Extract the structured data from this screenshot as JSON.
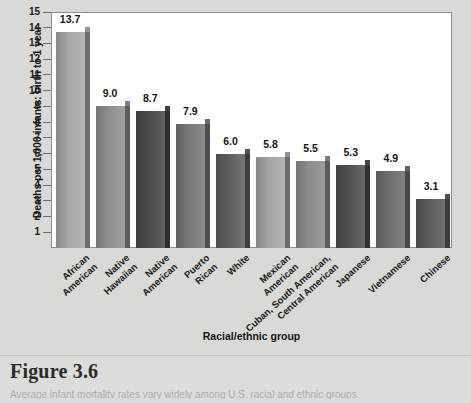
{
  "chart_data": {
    "type": "bar",
    "title": "",
    "xlabel": "Racial/ethnic group",
    "ylabel": "Deaths per 1,000 infants: birth to 1 year",
    "ylim": [
      0,
      15
    ],
    "yticks": [
      15,
      14,
      13,
      12,
      11,
      10,
      9,
      8,
      7,
      6,
      5,
      4,
      3,
      2,
      1
    ],
    "grid": false,
    "legend": "none",
    "categories": [
      "African\nAmerican",
      "Native\nHawaiian",
      "Native\nAmerican",
      "Puerto\nRican",
      "White",
      "Mexican\nAmerican",
      "Cuban, South American,\nCentral American",
      "Japanese",
      "Vietnamese",
      "Chinese"
    ],
    "values": [
      13.7,
      9.0,
      8.7,
      7.9,
      6.0,
      5.8,
      5.5,
      5.3,
      4.9,
      3.1
    ],
    "value_labels": [
      "13.7",
      "9.0",
      "8.7",
      "7.9",
      "6.0",
      "5.8",
      "5.5",
      "5.3",
      "4.9",
      "3.1"
    ],
    "bar_colors": [
      "#a8a8a8",
      "#8f8f8f",
      "#4a4a4a",
      "#787878",
      "#5e5e5e",
      "#a5a5a5",
      "#8c8c8c",
      "#4f4f4f",
      "#6d6d6d",
      "#5a5a5a"
    ]
  },
  "axis": {
    "y_title": "Deaths per 1,000 infants: birth to 1 year",
    "x_title": "Racial/ethnic group",
    "y_tick_labels": [
      "15",
      "14",
      "13",
      "12",
      "11",
      "10",
      "9",
      "8",
      "7",
      "6",
      "5",
      "4",
      "3",
      "2",
      "1"
    ]
  },
  "category_labels": [
    [
      "African",
      "American"
    ],
    [
      "Native",
      "Hawaiian"
    ],
    [
      "Native",
      "American"
    ],
    [
      "Puerto",
      "Rican"
    ],
    [
      "White"
    ],
    [
      "Mexican",
      "American"
    ],
    [
      "Cuban, South American,",
      "Central American"
    ],
    [
      "Japanese"
    ],
    [
      "Vietnamese"
    ],
    [
      "Chinese"
    ]
  ],
  "caption": {
    "figure_number": "Figure 3.6",
    "text": "Average infant mortality rates vary widely among U.S. racial and ethnic groups."
  },
  "colors": {
    "page_background": "#d9d9d7",
    "plot_background": "#ffffff",
    "axis_line": "#8e8e8e",
    "text": "#1a1a1a"
  }
}
